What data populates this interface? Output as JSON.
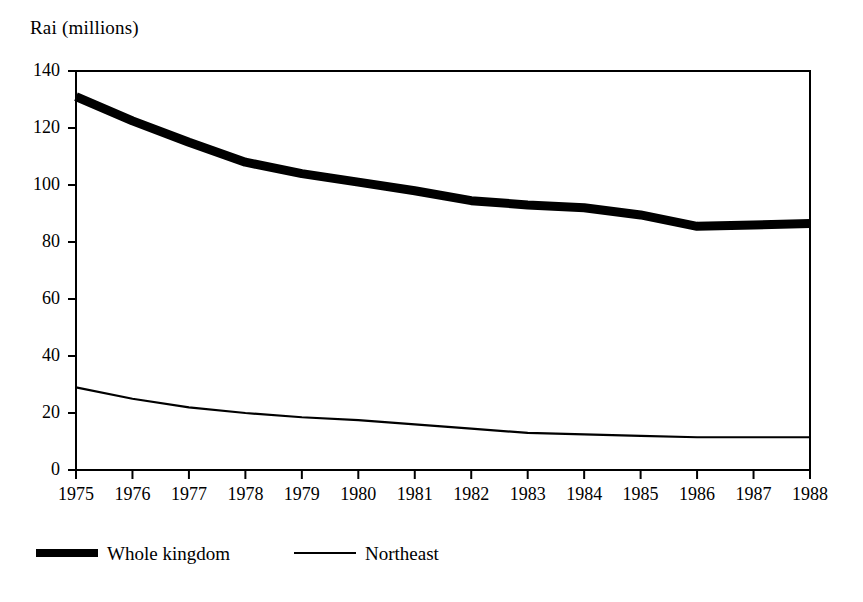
{
  "chart_data": {
    "type": "line",
    "title": "",
    "ylabel": "Rai (millions)",
    "xlabel": "",
    "ylim": [
      0,
      140
    ],
    "yticks": [
      0,
      20,
      40,
      60,
      80,
      100,
      120,
      140
    ],
    "grid": false,
    "legend_position": "bottom-left",
    "categories": [
      "1975",
      "1976",
      "1977",
      "1978",
      "1979",
      "1980",
      "1981",
      "1982",
      "1983",
      "1984",
      "1985",
      "1986",
      "1987",
      "1988"
    ],
    "x": [
      1975,
      1976,
      1977,
      1978,
      1979,
      1980,
      1981,
      1982,
      1983,
      1984,
      1985,
      1986,
      1987,
      1988
    ],
    "series": [
      {
        "name": "Whole kingdom",
        "style": "thick",
        "values": [
          131,
          122.5,
          115,
          108,
          104,
          101,
          98,
          94.5,
          93,
          92,
          89.5,
          85.5,
          86,
          86.5
        ]
      },
      {
        "name": "Northeast",
        "style": "thin",
        "values": [
          29,
          25,
          22,
          20,
          18.5,
          17.5,
          16,
          14.5,
          13,
          12.5,
          12,
          11.5,
          11.5,
          11.5
        ]
      }
    ]
  },
  "axis": {
    "y_title": "Rai (millions)",
    "y_tick_labels": [
      "140",
      "120",
      "100",
      "80",
      "60",
      "40",
      "20",
      "0"
    ],
    "x_tick_labels": [
      "1975",
      "1976",
      "1977",
      "1978",
      "1979",
      "1980",
      "1981",
      "1982",
      "1983",
      "1984",
      "1985",
      "1986",
      "1987",
      "1988"
    ]
  },
  "legend": {
    "entries": [
      {
        "label": "Whole kingdom",
        "style": "thick"
      },
      {
        "label": "Northeast",
        "style": "thin"
      }
    ]
  },
  "colors": {
    "ink": "#000000",
    "background": "#ffffff"
  }
}
